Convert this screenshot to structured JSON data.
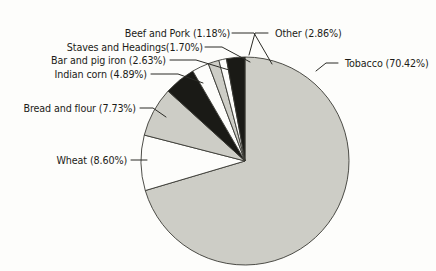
{
  "chart_data": {
    "type": "pie",
    "title": "",
    "subtitle": "",
    "xlabel": "",
    "ylabel": "",
    "legend_position": "none",
    "grid": false,
    "units": "percent",
    "start_angle_deg": 0,
    "direction": "clockwise",
    "categories": [
      "Tobacco",
      "Wheat",
      "Bread and flour",
      "Indian corn",
      "Bar and pig iron",
      "Staves and Headings",
      "Beef and Pork",
      "Other"
    ],
    "values": [
      70.42,
      8.6,
      7.73,
      4.89,
      2.63,
      1.7,
      1.18,
      2.86
    ],
    "slice_colors": [
      "#cdcdc6",
      "#fdfdfb",
      "#cdcdc6",
      "#1a1a16",
      "#fdfdfb",
      "#cdcdc6",
      "#fdfdfb",
      "#1a1a16"
    ],
    "labels": [
      "Tobacco (70.42%)",
      "Wheat (8.60%)",
      "Bread and flour (7.73%)",
      "Indian corn (4.89%)",
      "Bar and pig iron (2.63%)",
      "Staves and Headings(1.70%)",
      "Beef and Pork (1.18%)",
      "Other (2.86%)"
    ]
  },
  "colors": {
    "background": "#fdfdfb",
    "slice_gray": "#cdcdc6",
    "slice_black": "#1a1a16",
    "slice_white": "#fdfdfb",
    "outline": "#3a3a34",
    "text": "#1c1c18",
    "leader": "#2b2b26"
  }
}
